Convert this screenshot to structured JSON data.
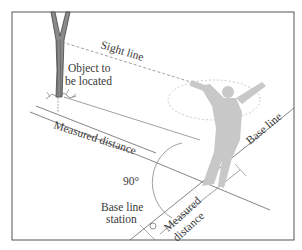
{
  "figure": {
    "type": "illustration"
  },
  "labels": {
    "sight_line": "Sight line",
    "object_line1": "Object to",
    "object_line2": "be located",
    "measured_distance_1": "Measured distance",
    "base_line": "Base line",
    "angle": "90°",
    "station_line1": "Base line",
    "station_line2": "station",
    "measured_distance_2a": "Measured",
    "measured_distance_2b": "distance"
  },
  "colors": {
    "frame": "#555555",
    "line": "#666666",
    "figure_silhouette": "#c8c8c8",
    "text": "#3a3a3a"
  }
}
